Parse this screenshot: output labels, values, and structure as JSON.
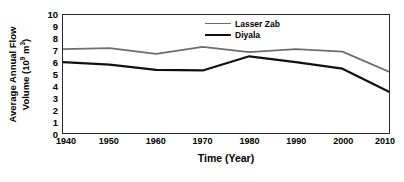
{
  "chart_data": {
    "type": "line",
    "title": "",
    "xlabel": "Time (Year)",
    "ylabel_line1": "Average Annual Flow",
    "ylabel_line2_pre": "Volume (10",
    "ylabel_line2_sup1": "9",
    "ylabel_line2_mid": " m",
    "ylabel_line2_sup2": "3",
    "ylabel_line2_post": ")",
    "x": [
      1940,
      1950,
      1960,
      1970,
      1980,
      1990,
      2000,
      2010
    ],
    "xticklabels": [
      "1940",
      "1950",
      "1960",
      "1970",
      "1980",
      "1990",
      "2000",
      "2010"
    ],
    "yticklabels": [
      "10",
      "9",
      "8",
      "7",
      "6",
      "5",
      "4",
      "3",
      "2",
      "1",
      "0"
    ],
    "yticks": [
      10,
      9,
      8,
      7,
      6,
      5,
      4,
      3,
      2,
      1,
      0
    ],
    "xlim": [
      1940,
      2010
    ],
    "ylim": [
      0,
      10
    ],
    "grid": false,
    "legend_position": "top-right",
    "series": [
      {
        "name": "Lasser Zab",
        "color": "#6e6e6e",
        "linewidth": 1.8,
        "values": [
          7.1,
          7.2,
          6.7,
          7.3,
          6.85,
          7.1,
          6.9,
          5.2
        ]
      },
      {
        "name": "Diyala",
        "color": "#111111",
        "linewidth": 2.2,
        "values": [
          6.0,
          5.8,
          5.35,
          5.3,
          6.5,
          6.0,
          5.45,
          3.5
        ]
      }
    ]
  }
}
